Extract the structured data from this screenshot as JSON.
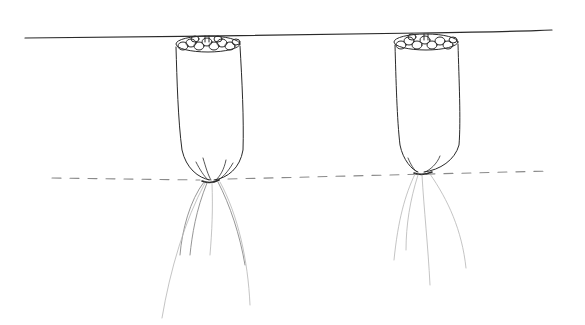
{
  "figure": {
    "type": "hand-drawn sketch",
    "colors": {
      "background": "#ffffff",
      "ink": "#2a2a2a",
      "light_ink": "#8a8a8a",
      "faint_ink": "#b5b5b5"
    },
    "elements": {
      "top_line": {
        "x1": 25,
        "y1": 38,
        "x2": 552,
        "y2": 30
      },
      "dashed_line": {
        "x1": 52,
        "y1": 178,
        "x2": 550,
        "y2": 171
      },
      "pouches": [
        {
          "id": "left",
          "top_left_x": 175,
          "top_right_x": 240,
          "top_y": 43,
          "knot_x": 212,
          "knot_y": 181
        },
        {
          "id": "right",
          "top_left_x": 394,
          "top_right_x": 458,
          "top_y": 41,
          "knot_x": 420,
          "knot_y": 173
        }
      ]
    }
  }
}
